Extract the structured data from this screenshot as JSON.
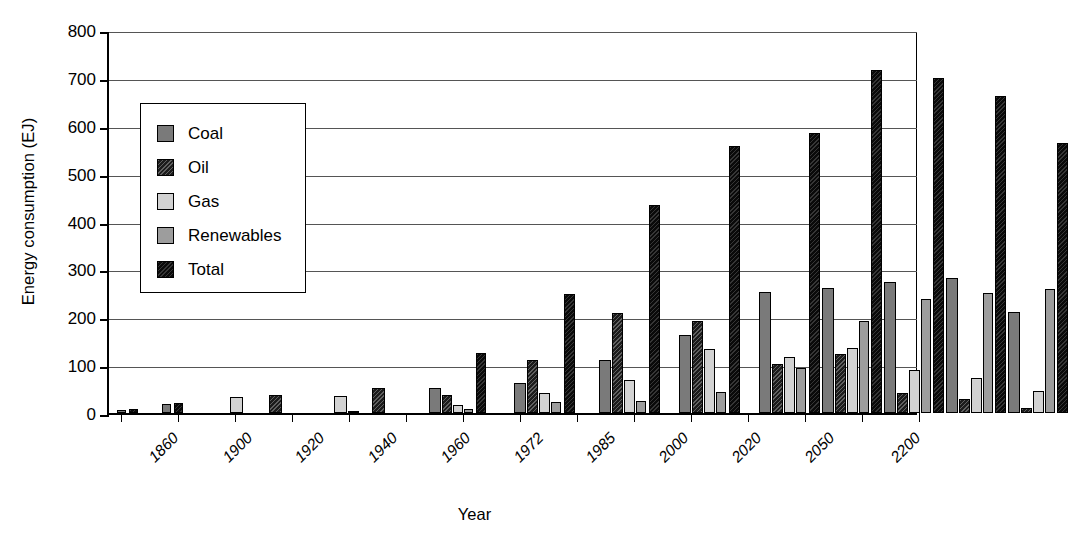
{
  "chart_data": {
    "type": "bar",
    "title": "",
    "xlabel": "Year",
    "ylabel": "Energy consumption (EJ)",
    "ylim": [
      0,
      800
    ],
    "yticks": [
      0,
      100,
      200,
      300,
      400,
      500,
      600,
      700,
      800
    ],
    "grid": "horizontal",
    "legend_position": "upper-left-inset",
    "categories": [
      "1860",
      "1900",
      "1920",
      "1940",
      "1960",
      "1972",
      "1985",
      "2000",
      "2020",
      "2050",
      "2200"
    ],
    "series": [
      {
        "name": "Coal",
        "color": "#7a7a7a"
      },
      {
        "name": "Oil",
        "color": "#1c1c1c"
      },
      {
        "name": "Gas",
        "color": "#d2d2d2"
      },
      {
        "name": "Renewables",
        "color": "#9d9d9d"
      },
      {
        "name": "Total",
        "color": "#0a0a0a"
      }
    ],
    "groups": [
      {
        "year": "1860",
        "bars": [
          {
            "series": "Coal",
            "value": 7
          },
          {
            "series": "Total",
            "value": 9
          }
        ]
      },
      {
        "year": "1900",
        "bars": [
          {
            "series": "Coal",
            "value": 19
          },
          {
            "series": "Total",
            "value": 21
          }
        ]
      },
      {
        "year": "1920",
        "bars": [
          {
            "series": "Coal",
            "value": 33
          },
          {
            "series": "Oil",
            "value": 4
          },
          {
            "series": "Total",
            "value": 38
          }
        ]
      },
      {
        "year": "1940",
        "bars": [
          {
            "series": "Coal",
            "value": 35
          },
          {
            "series": "Oil",
            "value": 11
          },
          {
            "series": "Gas",
            "value": 5
          },
          {
            "series": "Total",
            "value": 52
          }
        ]
      },
      {
        "year": "1960",
        "bars": [
          {
            "series": "Coal",
            "value": 53
          },
          {
            "series": "Oil",
            "value": 38
          },
          {
            "series": "Gas",
            "value": 17
          },
          {
            "series": "Renewables",
            "value": 8
          },
          {
            "series": "Total",
            "value": 125
          }
        ]
      },
      {
        "year": "1972",
        "bars": [
          {
            "series": "Coal",
            "value": 62
          },
          {
            "series": "Oil",
            "value": 110
          },
          {
            "series": "Gas",
            "value": 42
          },
          {
            "series": "Renewables",
            "value": 24
          },
          {
            "series": "Total",
            "value": 249
          }
        ]
      },
      {
        "year": "1985",
        "bars": [
          {
            "series": "Coal",
            "value": 111
          },
          {
            "series": "Oil",
            "value": 209
          },
          {
            "series": "Gas",
            "value": 70
          },
          {
            "series": "Renewables",
            "value": 25
          },
          {
            "series": "Total",
            "value": 435
          }
        ]
      },
      {
        "year": "2000",
        "bars": [
          {
            "series": "Coal",
            "value": 162
          },
          {
            "series": "Oil",
            "value": 193
          },
          {
            "series": "Gas",
            "value": 134
          },
          {
            "series": "Renewables",
            "value": 43
          },
          {
            "series": "Total",
            "value": 558
          }
        ]
      },
      {
        "year": "2020",
        "bars": [
          {
            "series": "Coal",
            "value": 253
          },
          {
            "series": "Oil",
            "value": 103
          },
          {
            "series": "Gas",
            "value": 117
          },
          {
            "series": "Renewables",
            "value": 93
          },
          {
            "series": "Total",
            "value": 584
          },
          {
            "series": "Coal",
            "value": 261
          },
          {
            "series": "Oil",
            "value": 123
          },
          {
            "series": "Gas",
            "value": 136
          },
          {
            "series": "Renewables",
            "value": 193
          }
        ]
      },
      {
        "year": "2050",
        "bars": [
          {
            "series": "Total",
            "value": 717
          },
          {
            "series": "Coal",
            "value": 274
          },
          {
            "series": "Oil",
            "value": 42
          },
          {
            "series": "Gas",
            "value": 89
          },
          {
            "series": "Renewables",
            "value": 239
          },
          {
            "series": "Total",
            "value": 700
          },
          {
            "series": "Coal",
            "value": 283
          },
          {
            "series": "Oil",
            "value": 30
          },
          {
            "series": "Gas",
            "value": 74
          },
          {
            "series": "Renewables",
            "value": 250
          }
        ]
      },
      {
        "year": "2200",
        "bars": [
          {
            "series": "Total",
            "value": 663
          },
          {
            "series": "Gas",
            "value": 211
          },
          {
            "series": "Oil",
            "value": 11
          },
          {
            "series": "Renewables",
            "value": 46
          },
          {
            "series": "Gas",
            "value": 259
          },
          {
            "series": "Total",
            "value": 565
          }
        ]
      }
    ],
    "bar_layout": [
      {
        "x": 8,
        "w": 9,
        "v": 7,
        "s": "coal"
      },
      {
        "x": 20,
        "w": 9,
        "v": 9,
        "s": "total"
      },
      {
        "x": 53,
        "w": 9,
        "v": 19,
        "s": "coal"
      },
      {
        "x": 65,
        "w": 9,
        "v": 21,
        "s": "total"
      },
      {
        "x": 121,
        "w": 13,
        "v": 33,
        "s": "gas"
      },
      {
        "x": 160,
        "w": 13,
        "v": 38,
        "s": "oil"
      },
      {
        "x": 225,
        "w": 13,
        "v": 35,
        "s": "gas"
      },
      {
        "x": 239,
        "w": 11,
        "v": 5,
        "s": "renew"
      },
      {
        "x": 263,
        "w": 13,
        "v": 52,
        "s": "oil"
      },
      {
        "x": 320,
        "w": 12,
        "v": 53,
        "s": "coal"
      },
      {
        "x": 333,
        "w": 10,
        "v": 38,
        "s": "oil"
      },
      {
        "x": 344,
        "w": 10,
        "v": 17,
        "s": "gas"
      },
      {
        "x": 355,
        "w": 9,
        "v": 8,
        "s": "renew"
      },
      {
        "x": 367,
        "w": 10,
        "v": 125,
        "s": "total"
      },
      {
        "x": 405,
        "w": 12,
        "v": 62,
        "s": "coal"
      },
      {
        "x": 418,
        "w": 11,
        "v": 110,
        "s": "oil"
      },
      {
        "x": 430,
        "w": 11,
        "v": 42,
        "s": "gas"
      },
      {
        "x": 442,
        "w": 10,
        "v": 24,
        "s": "renew"
      },
      {
        "x": 455,
        "w": 11,
        "v": 249,
        "s": "total"
      },
      {
        "x": 490,
        "w": 12,
        "v": 111,
        "s": "coal"
      },
      {
        "x": 503,
        "w": 11,
        "v": 209,
        "s": "oil"
      },
      {
        "x": 515,
        "w": 11,
        "v": 70,
        "s": "gas"
      },
      {
        "x": 527,
        "w": 10,
        "v": 25,
        "s": "renew"
      },
      {
        "x": 540,
        "w": 11,
        "v": 435,
        "s": "total"
      },
      {
        "x": 570,
        "w": 12,
        "v": 162,
        "s": "coal"
      },
      {
        "x": 583,
        "w": 11,
        "v": 193,
        "s": "oil"
      },
      {
        "x": 595,
        "w": 11,
        "v": 134,
        "s": "gas"
      },
      {
        "x": 607,
        "w": 10,
        "v": 43,
        "s": "renew"
      },
      {
        "x": 620,
        "w": 11,
        "v": 558,
        "s": "total"
      },
      {
        "x": 650,
        "w": 12,
        "v": 253,
        "s": "coal"
      },
      {
        "x": 663,
        "w": 11,
        "v": 103,
        "s": "oil"
      },
      {
        "x": 675,
        "w": 11,
        "v": 117,
        "s": "gas"
      },
      {
        "x": 687,
        "w": 10,
        "v": 93,
        "s": "renew"
      },
      {
        "x": 700,
        "w": 11,
        "v": 584,
        "s": "total"
      },
      {
        "x": 713,
        "w": 12,
        "v": 261,
        "s": "coal"
      },
      {
        "x": 726,
        "w": 11,
        "v": 123,
        "s": "oil"
      },
      {
        "x": 738,
        "w": 11,
        "v": 136,
        "s": "gas"
      },
      {
        "x": 750,
        "w": 10,
        "v": 193,
        "s": "renew"
      },
      {
        "x": 762,
        "w": 11,
        "v": 717,
        "s": "total"
      },
      {
        "x": 775,
        "w": 12,
        "v": 274,
        "s": "coal"
      },
      {
        "x": 788,
        "w": 11,
        "v": 42,
        "s": "oil"
      },
      {
        "x": 800,
        "w": 11,
        "v": 89,
        "s": "gas"
      },
      {
        "x": 812,
        "w": 10,
        "v": 239,
        "s": "renew"
      },
      {
        "x": 824,
        "w": 11,
        "v": 700,
        "s": "total"
      },
      {
        "x": 837,
        "w": 12,
        "v": 283,
        "s": "coal"
      },
      {
        "x": 850,
        "w": 11,
        "v": 30,
        "s": "oil"
      },
      {
        "x": 862,
        "w": 11,
        "v": 74,
        "s": "gas"
      },
      {
        "x": 874,
        "w": 10,
        "v": 250,
        "s": "renew"
      },
      {
        "x": 886,
        "w": 11,
        "v": 663,
        "s": "total"
      },
      {
        "x": 899,
        "w": 12,
        "v": 211,
        "s": "coal"
      },
      {
        "x": 912,
        "w": 11,
        "v": 11,
        "s": "oil"
      },
      {
        "x": 924,
        "w": 11,
        "v": 46,
        "s": "gas"
      },
      {
        "x": 936,
        "w": 10,
        "v": 259,
        "s": "renew"
      },
      {
        "x": 948,
        "w": 11,
        "v": 565,
        "s": "total"
      }
    ],
    "xtick_positions": [
      12,
      69,
      126,
      183,
      240,
      297,
      354,
      411,
      468,
      525,
      582,
      639,
      696,
      753,
      810
    ],
    "xlabel_positions": [
      26,
      100,
      172,
      245,
      318,
      391,
      463,
      536,
      609,
      682,
      768
    ]
  },
  "legend": {
    "items": [
      {
        "label": "Coal",
        "swatch": "s-coal"
      },
      {
        "label": "Oil",
        "swatch": "s-oil"
      },
      {
        "label": "Gas",
        "swatch": "s-gas"
      },
      {
        "label": "Renewables",
        "swatch": "s-renew"
      },
      {
        "label": "Total",
        "swatch": "s-total"
      }
    ]
  }
}
